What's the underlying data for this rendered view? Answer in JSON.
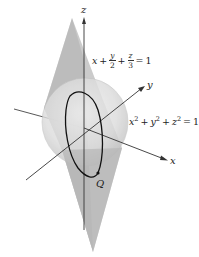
{
  "figure": {
    "axes": {
      "x_label": "x",
      "y_label": "y",
      "z_label": "z"
    },
    "plane_equation": {
      "term1": "x",
      "plus1": "+",
      "frac1_num": "y",
      "frac1_den": "2",
      "plus2": "+",
      "frac2_num": "z",
      "frac2_den": "3",
      "equals": "=",
      "rhs": "1"
    },
    "sphere_equation": {
      "x_term": "x",
      "x_exp": "2",
      "plus1": "+",
      "y_term": "y",
      "y_exp": "2",
      "plus2": "+",
      "z_term": "z",
      "z_exp": "2",
      "equals": "=",
      "rhs": "1"
    },
    "point_label": "Q",
    "colors": {
      "plane_fill": "#b8b8b8",
      "sphere_fill": "#d9d9d9",
      "axis": "#333333",
      "curve": "#111111"
    }
  }
}
